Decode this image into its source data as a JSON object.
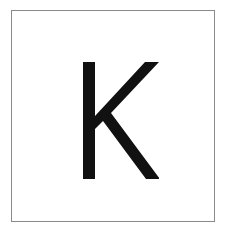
{
  "card": {
    "letter": "K",
    "letter_color": "#111111",
    "border_color": "#8a8a8a",
    "background": "#ffffff"
  }
}
